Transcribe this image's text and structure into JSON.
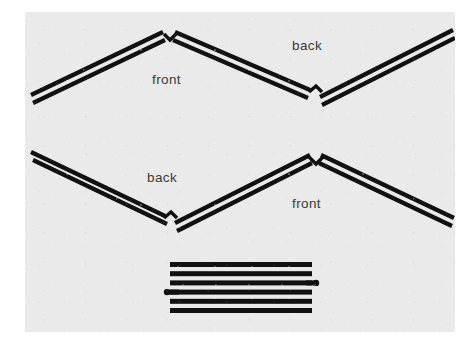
{
  "figure": {
    "canvas": {
      "width": 468,
      "height": 350
    },
    "panel": {
      "x": 25,
      "y": 12,
      "width": 430,
      "height": 320,
      "color": "#eaeaea"
    },
    "page_background": "#ffffff",
    "ink_color": "#111111",
    "label_color": "#3a3a3a"
  },
  "labels": [
    {
      "id": "front-top",
      "text": "front",
      "x": 152,
      "y": 72
    },
    {
      "id": "back-top",
      "text": "back",
      "x": 292,
      "y": 38
    },
    {
      "id": "back-bottom",
      "text": "back",
      "x": 147,
      "y": 170
    },
    {
      "id": "front-bottom",
      "text": "front",
      "x": 292,
      "y": 196
    }
  ],
  "figures": {
    "top_zigzag": {
      "name": "upper-zigzag",
      "description": "Double-stroked zigzag: rises from lower-left to a peak, falls to a valley, rises to upper-right.",
      "vertices": [
        {
          "x": 32,
          "y": 100
        },
        {
          "x": 168,
          "y": 35
        },
        {
          "x": 315,
          "y": 97
        },
        {
          "x": 452,
          "y": 33
        }
      ],
      "stroke_pairs": 2,
      "pair_gap": 6,
      "stroke_width": 4.2,
      "notch": "arrow-shaped cleft at each vertex"
    },
    "bottom_zigzag": {
      "name": "lower-zigzag",
      "description": "Double-stroked zigzag: falls from upper-left to a valley, rises to a peak, falls to lower-right.",
      "vertices": [
        {
          "x": 32,
          "y": 155
        },
        {
          "x": 170,
          "y": 222
        },
        {
          "x": 315,
          "y": 157
        },
        {
          "x": 452,
          "y": 223
        }
      ],
      "stroke_pairs": 2,
      "pair_gap": 6,
      "stroke_width": 4.2,
      "notch": "arrow-shaped cleft at each vertex"
    },
    "bar_stack": {
      "name": "horizontal-bar-stack",
      "description": "Six flat horizontal bars stacked vertically, with small rounded stub markers.",
      "bar_count": 6,
      "bar_left": 170,
      "bar_right": 312,
      "bar_height": 5,
      "bar_spacing": 9.2,
      "bar_top": 263,
      "markers": [
        {
          "id": "right-stub",
          "side": "right",
          "bar_index": 2,
          "x": 316,
          "y": 281,
          "radius": 3.2
        },
        {
          "id": "left-stub",
          "side": "left",
          "bar_index": 3,
          "x": 167,
          "y": 290,
          "radius": 3.2
        }
      ]
    }
  }
}
